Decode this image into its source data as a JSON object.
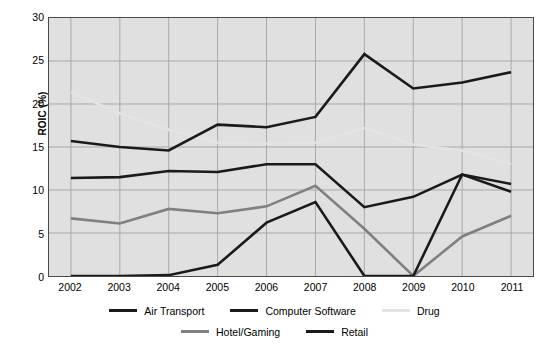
{
  "chart_data": {
    "type": "line",
    "title": "",
    "xlabel": "",
    "ylabel": "ROIC (%)",
    "categories": [
      "2002",
      "2003",
      "2004",
      "2005",
      "2006",
      "2007",
      "2008",
      "2009",
      "2010",
      "2011"
    ],
    "x": [
      2002,
      2003,
      2004,
      2005,
      2006,
      2007,
      2008,
      2009,
      2010,
      2011
    ],
    "ylim": [
      0,
      30
    ],
    "yticks": [
      0,
      5,
      10,
      15,
      20,
      25,
      30
    ],
    "grid": true,
    "legend_position": "bottom",
    "series": [
      {
        "name": "Air Transport",
        "color": "#1a1a1a",
        "values": [
          11.4,
          11.5,
          12.2,
          12.1,
          13.0,
          13.0,
          8.0,
          9.2,
          11.8,
          10.7
        ]
      },
      {
        "name": "Computer Software",
        "color": "#1a1a1a",
        "values": [
          15.7,
          15.0,
          14.6,
          17.6,
          17.3,
          18.5,
          25.8,
          21.8,
          22.5,
          23.7
        ]
      },
      {
        "name": "Drug",
        "color": "#e3e3e3",
        "values": [
          21.4,
          18.9,
          17.0,
          15.5,
          15.4,
          15.5,
          17.2,
          15.3,
          14.6,
          13.0
        ]
      },
      {
        "name": "Hotel/Gaming",
        "color": "#808080",
        "values": [
          6.7,
          6.1,
          7.8,
          7.3,
          8.1,
          10.5,
          5.5,
          0.0,
          4.6,
          7.0
        ]
      },
      {
        "name": "Retail",
        "color": "#1a1a1a",
        "values": [
          0.0,
          0.0,
          0.1,
          1.3,
          6.2,
          8.6,
          0.0,
          0.0,
          11.8,
          9.8
        ]
      }
    ]
  },
  "legend": {
    "rows": [
      [
        {
          "label": "Air Transport",
          "color": "#1a1a1a"
        },
        {
          "label": "Computer Software",
          "color": "#1a1a1a"
        },
        {
          "label": "Drug",
          "color": "#e3e3e3"
        }
      ],
      [
        {
          "label": "Hotel/Gaming",
          "color": "#808080"
        },
        {
          "label": "Retail",
          "color": "#1a1a1a"
        }
      ]
    ]
  },
  "style": {
    "plot_background": "#e0e0e0",
    "grid_color": "#a8a8a8",
    "frame_color": "#4a4a4a",
    "page_background": "#ffffff"
  }
}
